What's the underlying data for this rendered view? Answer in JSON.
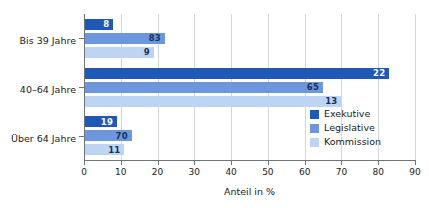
{
  "chart_data": {
    "type": "bar",
    "orientation": "horizontal",
    "title": "",
    "xlabel": "Anteil in %",
    "ylabel": "",
    "xlim": [
      0,
      90
    ],
    "xticks": [
      0,
      10,
      20,
      30,
      40,
      50,
      60,
      70,
      80,
      90
    ],
    "xtick_labels": [
      "0",
      "10",
      "20",
      "30",
      "40",
      "50",
      "60",
      "70",
      "80",
      "90"
    ],
    "grid": "vertical",
    "legend_position": "inside-bottom-right",
    "categories": [
      "Bis 39 Jahre",
      "40–64 Jahre",
      "Über 64 Jahre"
    ],
    "series": [
      {
        "name": "Exekutive",
        "color": "#2058b8",
        "label_color": "#ffffff",
        "values": [
          8,
          83,
          9
        ]
      },
      {
        "name": "Legislative",
        "color": "#6e96dc",
        "label_color": "#16305e",
        "values": [
          22,
          65,
          13
        ]
      },
      {
        "name": "Kommission",
        "color": "#bdd4f2",
        "label_color": "#16305e",
        "values": [
          19,
          70,
          11
        ]
      }
    ],
    "data_labels": [
      [
        "8",
        "22",
        "19"
      ],
      [
        "83",
        "65",
        "70"
      ],
      [
        "9",
        "13",
        "11"
      ]
    ]
  },
  "axis": {
    "x_title": "Anteil in %"
  },
  "legend": {
    "items": [
      {
        "label": "Exekutive",
        "color": "#2058b8"
      },
      {
        "label": "Legislative",
        "color": "#6e96dc"
      },
      {
        "label": "Kommission",
        "color": "#bdd4f2"
      }
    ]
  },
  "colors": {
    "exekutive": "#2058b8",
    "legislative": "#6e96dc",
    "kommission": "#bdd4f2",
    "gridline": "#d3d6dd",
    "axis": "#6f737b",
    "text": "#1b1b1b",
    "dark_label": "#16305e",
    "background": "#ffffff"
  }
}
